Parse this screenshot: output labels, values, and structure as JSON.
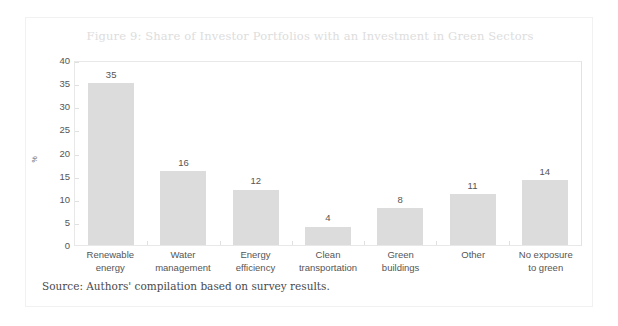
{
  "figure": {
    "title": "Figure 9: Share of Investor Portfolios with an Investment in Green Sectors",
    "source": "Source: Authors' compilation based on survey results.",
    "colors": {
      "bar_fill": "#dcdcdc",
      "title_text": "#dddddd",
      "axis_text": "#555555",
      "frame": "#e8e8e8",
      "card_border": "#f1f1f1",
      "background": "#ffffff"
    }
  },
  "chart_data": {
    "type": "bar",
    "title": "Figure 9: Share of Investor Portfolios with an Investment in Green Sectors",
    "xlabel": "",
    "ylabel": "%",
    "ylim": [
      0,
      40
    ],
    "yticks": [
      0,
      5,
      10,
      15,
      20,
      25,
      30,
      35,
      40
    ],
    "ytick_labels": [
      "0",
      "5",
      "10",
      "15",
      "20",
      "25",
      "30",
      "35",
      "40"
    ],
    "grid": false,
    "legend": false,
    "categories": [
      "Renewable energy",
      "Water management",
      "Energy efficiency",
      "Clean transportation",
      "Green buildings",
      "Other",
      "No exposure to green"
    ],
    "category_lines": [
      [
        "Renewable",
        "energy"
      ],
      [
        "Water",
        "management"
      ],
      [
        "Energy",
        "efficiency"
      ],
      [
        "Clean",
        "transportation"
      ],
      [
        "Green",
        "buildings"
      ],
      [
        "Other"
      ],
      [
        "No exposure",
        "to green"
      ]
    ],
    "values": [
      35,
      16,
      12,
      4,
      8,
      11,
      14
    ],
    "value_labels": [
      "35",
      "16",
      "12",
      "4",
      "8",
      "11",
      "14"
    ]
  }
}
